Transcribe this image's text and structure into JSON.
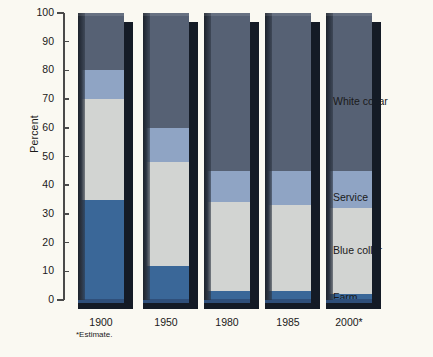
{
  "chart_data": {
    "type": "bar",
    "subtype": "stacked-column-100",
    "title": "",
    "xlabel": "",
    "ylabel": "Percent",
    "ylim": [
      0,
      100
    ],
    "yticks": [
      0,
      10,
      20,
      30,
      40,
      50,
      60,
      70,
      80,
      90,
      100
    ],
    "ytick_labels": [
      "0",
      "10",
      "20",
      "30",
      "40",
      "50",
      "60",
      "70",
      "80",
      "90",
      "100"
    ],
    "grid": false,
    "legend_position": "right-inline",
    "categories": [
      "1900",
      "1950",
      "1980",
      "1985",
      "2000*"
    ],
    "series": [
      {
        "name": "Farm",
        "color": "#3a6798",
        "values": [
          35,
          12,
          3,
          3,
          2
        ]
      },
      {
        "name": "Blue collar",
        "color": "#d2d4d2",
        "values": [
          35,
          36,
          31,
          30,
          30
        ]
      },
      {
        "name": "Service",
        "color": "#8fa4c4",
        "values": [
          10,
          12,
          11,
          12,
          13
        ]
      },
      {
        "name": "White collar",
        "color": "#566174",
        "values": [
          20,
          40,
          55,
          55,
          55
        ]
      }
    ],
    "annotations": [
      "*Estimate."
    ]
  },
  "axis": {
    "y_title": "Percent",
    "ticks": [
      {
        "label": "100"
      },
      {
        "label": "90"
      },
      {
        "label": "80"
      },
      {
        "label": "70"
      },
      {
        "label": "60"
      },
      {
        "label": "50"
      },
      {
        "label": "40"
      },
      {
        "label": "30"
      },
      {
        "label": "20"
      },
      {
        "label": "10"
      },
      {
        "label": "0"
      }
    ]
  },
  "bars": [
    {
      "x_label": "1900",
      "segments": [
        {
          "name": "White collar",
          "value": 20,
          "top": 100,
          "bottom": 80
        },
        {
          "name": "Service",
          "value": 10,
          "top": 80,
          "bottom": 70
        },
        {
          "name": "Blue collar",
          "value": 35,
          "top": 70,
          "bottom": 35
        },
        {
          "name": "Farm",
          "value": 35,
          "top": 35,
          "bottom": 0
        }
      ]
    },
    {
      "x_label": "1950",
      "segments": [
        {
          "name": "White collar",
          "value": 40,
          "top": 100,
          "bottom": 60
        },
        {
          "name": "Service",
          "value": 12,
          "top": 60,
          "bottom": 48
        },
        {
          "name": "Blue collar",
          "value": 36,
          "top": 48,
          "bottom": 12
        },
        {
          "name": "Farm",
          "value": 12,
          "top": 12,
          "bottom": 0
        }
      ]
    },
    {
      "x_label": "1980",
      "segments": [
        {
          "name": "White collar",
          "value": 55,
          "top": 100,
          "bottom": 45
        },
        {
          "name": "Service",
          "value": 11,
          "top": 45,
          "bottom": 34
        },
        {
          "name": "Blue collar",
          "value": 31,
          "top": 34,
          "bottom": 3
        },
        {
          "name": "Farm",
          "value": 3,
          "top": 3,
          "bottom": 0
        }
      ]
    },
    {
      "x_label": "1985",
      "segments": [
        {
          "name": "White collar",
          "value": 55,
          "top": 100,
          "bottom": 45
        },
        {
          "name": "Service",
          "value": 12,
          "top": 45,
          "bottom": 33
        },
        {
          "name": "Blue collar",
          "value": 30,
          "top": 33,
          "bottom": 3
        },
        {
          "name": "Farm",
          "value": 3,
          "top": 3,
          "bottom": 0
        }
      ]
    },
    {
      "x_label": "2000*",
      "segments": [
        {
          "name": "White collar",
          "value": 55,
          "top": 100,
          "bottom": 45
        },
        {
          "name": "Service",
          "value": 13,
          "top": 45,
          "bottom": 32
        },
        {
          "name": "Blue collar",
          "value": 30,
          "top": 32,
          "bottom": 2
        },
        {
          "name": "Farm",
          "value": 2,
          "top": 2,
          "bottom": 0
        }
      ]
    }
  ],
  "category_labels": [
    {
      "text": "White collar",
      "y": 96
    },
    {
      "text": "Service",
      "y": 192
    },
    {
      "text": "Blue collar",
      "y": 245
    },
    {
      "text": "Farm",
      "y": 292
    }
  ],
  "footnote": "*Estimate.",
  "colors": {
    "background": "#faf9f2",
    "axis": "#4a4a4a",
    "text": "#1a1a1a",
    "white_collar": "#566174",
    "service": "#8fa4c4",
    "blue_collar": "#d2d4d2",
    "farm": "#3a6798",
    "shadow": "#141b26"
  }
}
